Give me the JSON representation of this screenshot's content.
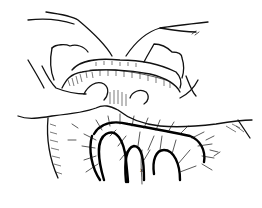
{
  "figure": {
    "labels": [
      {
        "id": "small-mark",
        "text": "x"
      }
    ],
    "colors": {
      "ink": "#111111",
      "background": "#ffffff"
    }
  }
}
